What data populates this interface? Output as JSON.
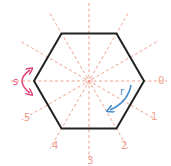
{
  "diagram": {
    "center": [
      89,
      81
    ],
    "hexagon": {
      "vertices": [
        [
          144,
          81
        ],
        [
          116.5,
          128.6
        ],
        [
          61.5,
          128.6
        ],
        [
          34,
          81
        ],
        [
          61.5,
          33.4
        ],
        [
          116.5,
          33.4
        ]
      ],
      "stroke": "#222222"
    },
    "axes": {
      "count": 6,
      "color": "#f2a090",
      "labels": [
        "0",
        "1",
        "2",
        "3",
        "4",
        "5"
      ]
    },
    "label_positions": [
      [
        158,
        84
      ],
      [
        151,
        120
      ],
      [
        121,
        149
      ],
      [
        87,
        164
      ],
      [
        52,
        149
      ],
      [
        24,
        121
      ]
    ],
    "rotation": {
      "label": "r",
      "color": "#4a8fcc"
    },
    "reflection": {
      "label": "s",
      "color": "#e04a7a"
    },
    "colors": {
      "hexagon": "#222222",
      "axis": "#f2a090",
      "axis_label": "#f0a090",
      "rotation_arrow": "#4a8fcc",
      "reflection_arrow": "#e04a7a"
    }
  }
}
